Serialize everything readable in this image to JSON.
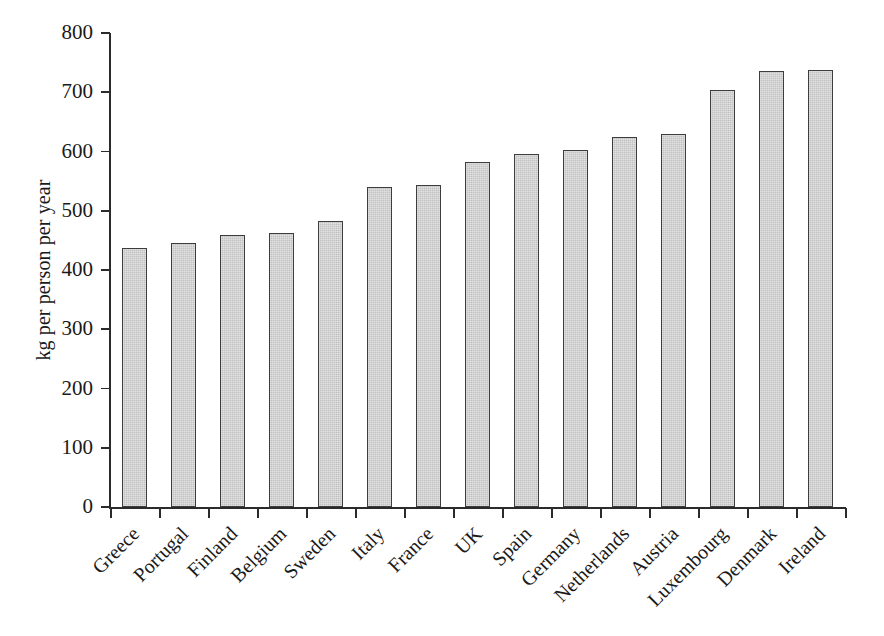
{
  "chart_data": {
    "type": "bar",
    "title": "",
    "subtitle": "",
    "xlabel": "",
    "ylabel": "kg per person per year",
    "ylim": [
      0,
      800
    ],
    "ytick_step": 100,
    "grid": false,
    "legend": null,
    "bar_fill_color": "#c2c2c2",
    "bar_border_color": "#3d3d3d",
    "axis_color": "#2b2b2b",
    "background_color": "#ffffff",
    "categories": [
      "Greece",
      "Portugal",
      "Finland",
      "Belgium",
      "Sweden",
      "Italy",
      "France",
      "UK",
      "Spain",
      "Germany",
      "Netherlands",
      "Austria",
      "Luxembourg",
      "Denmark",
      "Ireland"
    ],
    "values": [
      438,
      445,
      459,
      462,
      482,
      540,
      543,
      583,
      595,
      602,
      624,
      630,
      703,
      736,
      738
    ],
    "ytick_labels": [
      "0",
      "100",
      "200",
      "300",
      "400",
      "500",
      "600",
      "700",
      "800"
    ],
    "ytick_values": [
      0,
      100,
      200,
      300,
      400,
      500,
      600,
      700,
      800
    ]
  }
}
